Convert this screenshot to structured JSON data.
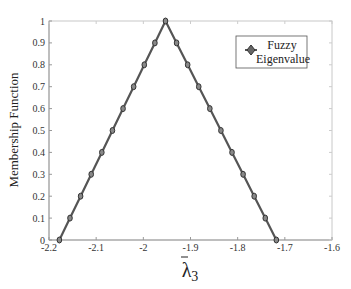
{
  "chart_data": {
    "type": "line",
    "title": "",
    "xlabel": "λ̃3",
    "xlabel_base": "λ",
    "xlabel_sub": "3",
    "ylabel": "Membership Function",
    "xlim": [
      -2.2,
      -1.6
    ],
    "ylim": [
      0,
      1
    ],
    "xticks": [
      -2.2,
      -2.1,
      -2.0,
      -1.9,
      -1.8,
      -1.7,
      -1.6
    ],
    "xtick_labels": [
      "-2.2",
      "-2.1",
      "-2",
      "-1.9",
      "-1.8",
      "-1.7",
      "-1.6"
    ],
    "yticks": [
      0,
      0.1,
      0.2,
      0.3,
      0.4,
      0.5,
      0.6,
      0.7,
      0.8,
      0.9,
      1
    ],
    "ytick_labels": [
      "0",
      "0.1",
      "0.2",
      "0.3",
      "0.4",
      "0.5",
      "0.6",
      "0.7",
      "0.8",
      "0.9",
      "1"
    ],
    "grid": false,
    "legend_position": "upper right",
    "series": [
      {
        "name": "Fuzzy Eigenvalue",
        "color": "#555555",
        "marker": "diamond",
        "x": [
          -2.178,
          -2.1555,
          -2.133,
          -2.1105,
          -2.088,
          -2.0655,
          -2.043,
          -2.0205,
          -1.998,
          -1.9755,
          -1.953,
          -1.9295,
          -1.906,
          -1.8825,
          -1.859,
          -1.8355,
          -1.812,
          -1.7885,
          -1.765,
          -1.7415,
          -1.718,
          -1.694,
          -1.67
        ],
        "y": [
          0,
          0.1,
          0.2,
          0.3,
          0.4,
          0.5,
          0.6,
          0.7,
          0.8,
          0.9,
          1.0,
          0.9,
          0.8,
          0.7,
          0.6,
          0.5,
          0.4,
          0.3,
          0.2,
          0.1,
          0.0,
          0.0,
          0.0
        ]
      }
    ]
  },
  "legend": {
    "line1": "Fuzzy",
    "line2": "Eigenvalue"
  }
}
